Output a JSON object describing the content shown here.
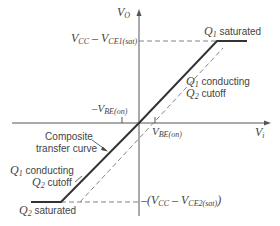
{
  "diagram": {
    "axes": {
      "y_label": "V",
      "y_label_sub": "O",
      "x_label": "V",
      "x_label_sub": "i"
    },
    "levels": {
      "top_prefix": "V",
      "top_sub1": "CC",
      "top_mid": " – V",
      "top_sub2": "CE1(sat)",
      "bottom_prefix": "–(V",
      "bottom_sub1": "CC",
      "bottom_mid": " – V",
      "bottom_sub2": "CE2(sat)",
      "bottom_suffix": ")"
    },
    "ticks": {
      "neg_vbe_prefix": "–V",
      "neg_vbe_sub": "BE(on)",
      "pos_vbe_prefix": "V",
      "pos_vbe_sub": "BE(on)"
    },
    "annotations": {
      "q1_saturated_q": "Q",
      "q1_saturated_sub": "1",
      "q1_saturated_text": "saturated",
      "q1_conducting_q": "Q",
      "q1_conducting_sub": "1",
      "q1_conducting_text": "conducting",
      "q2_cutoff_q": "Q",
      "q2_cutoff_sub": "2",
      "q2_cutoff_text": "cutoff",
      "left_q1_conducting_q": "Q",
      "left_q1_conducting_sub": "1",
      "left_q1_conducting_text": "conducting",
      "left_q2_cutoff_q": "Q",
      "left_q2_cutoff_sub": "2",
      "left_q2_cutoff_text": "cutoff",
      "q2_saturated_q": "Q",
      "q2_saturated_sub": "2",
      "q2_saturated_text": "saturated",
      "composite_line1": "Composite",
      "composite_line2": "transfer curve"
    },
    "colors": {
      "axis": "#555555",
      "curve": "#333333",
      "dashed": "#777777",
      "text": "#444444"
    }
  }
}
